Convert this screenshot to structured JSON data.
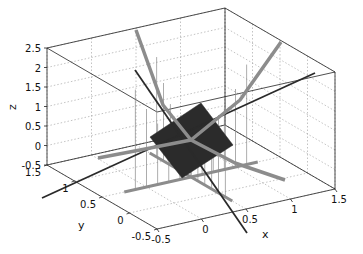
{
  "chart_data": {
    "type": "3d-line",
    "title": "",
    "xlabel": "x",
    "ylabel": "y",
    "zlabel": "z",
    "xlim": [
      -0.5,
      1.5
    ],
    "ylim": [
      -0.5,
      1.5
    ],
    "zlim": [
      -0.5,
      2.5
    ],
    "xticks": [
      "-0.5",
      "0",
      "0.5",
      "1",
      "1.5"
    ],
    "yticks": [
      "-0.5",
      "0",
      "0.5",
      "1",
      "1.5"
    ],
    "zticks": [
      "-0.5",
      "0",
      "0.5",
      "1",
      "1.5",
      "2",
      "2.5"
    ],
    "grid": true,
    "series": [
      {
        "name": "parabola-along-x",
        "style": "thick gray curve with vertical stems",
        "description": "z = 4(x-0.5)^2 + 0.5 curve in plane y = 0.5"
      },
      {
        "name": "parabola-along-y",
        "style": "thick gray curve with vertical stems",
        "description": "z = 4(y-0.5)^2 + 0.5 curve in plane x = 0.5"
      },
      {
        "name": "tangent-line-1",
        "style": "dark line",
        "description": "line through (0.5,0.5,0.5)"
      },
      {
        "name": "tangent-line-2",
        "style": "dark line",
        "description": "line through (0.5,0.5,0.5)"
      },
      {
        "name": "tangent-plane-patch",
        "style": "dark filled square",
        "description": "small square patch centered at (0.5,0.5,0.5)"
      }
    ]
  },
  "colors": {
    "box": "#222222",
    "grid": "#9a9a9a",
    "curve": "#8c8c8c",
    "line": "#2a2a2a",
    "patch": "#2b2b2b",
    "stem": "#888888"
  }
}
